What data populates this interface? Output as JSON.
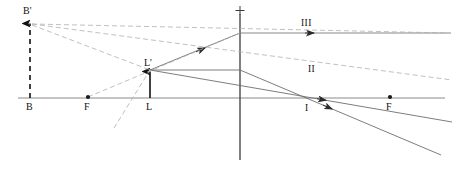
{
  "diagram": {
    "lens_sign": "+",
    "canvas": {
      "width": 476,
      "height": 174
    },
    "colors": {
      "solid_ray": "#555555",
      "dashed_ray": "#999999",
      "axis": "#777777",
      "lens": "#444444",
      "object": "#111111",
      "text": "#111111"
    },
    "points": [
      {
        "name": "B-prime",
        "label": "B'",
        "x": 30,
        "y": 22,
        "label_x": 23,
        "label_y": 14
      },
      {
        "name": "B",
        "label": "B",
        "x": 30,
        "y": 98,
        "label_x": 26,
        "label_y": 110
      },
      {
        "name": "F-left",
        "label": "F",
        "x": 88,
        "y": 97,
        "label_x": 84,
        "label_y": 110
      },
      {
        "name": "L-object",
        "label": "L",
        "x": 150,
        "y": 98,
        "label_x": 146,
        "label_y": 110
      },
      {
        "name": "L-prime-image",
        "label": "L'",
        "x": 150,
        "y": 70,
        "label_x": 144,
        "label_y": 65
      },
      {
        "name": "F-right",
        "label": "F",
        "x": 390,
        "y": 97,
        "label_x": 386,
        "label_y": 110
      }
    ],
    "rays": [
      {
        "name": "ray-one",
        "label": "I",
        "label_x": 305,
        "label_y": 111
      },
      {
        "name": "ray-two",
        "label": "II",
        "label_x": 308,
        "label_y": 72
      },
      {
        "name": "ray-three",
        "label": "III",
        "label_x": 301,
        "label_y": 26
      }
    ],
    "axis": {
      "name": "optical-axis",
      "x1": 18,
      "y1": 98,
      "x2": 445,
      "y2": 98
    },
    "lens": {
      "name": "lens-plane",
      "x": 240,
      "y_top": 14,
      "y_bottom": 160
    }
  }
}
